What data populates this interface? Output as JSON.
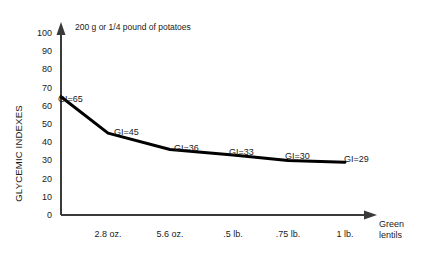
{
  "chart_data": {
    "type": "line",
    "title": "200 g or 1/4 pound of potatoes",
    "xlabel": "Green lentils",
    "ylabel": "GLYCEMIC INDEXES",
    "ylim": [
      0,
      100
    ],
    "yticks": [
      100,
      90,
      80,
      70,
      60,
      50,
      40,
      30,
      20,
      10,
      0
    ],
    "categories": [
      "",
      "2.8 oz.",
      "5.6 oz.",
      ".5 lb.",
      ".75 lb.",
      "1 lb."
    ],
    "values": [
      65,
      45,
      36,
      33,
      30,
      29
    ],
    "point_labels": [
      "GI=65",
      "GI=45",
      "GI=36",
      "GI=33",
      "GI=30",
      "GI=29"
    ],
    "grid": false,
    "legend": null,
    "line_color": "#000000",
    "axis_color": "#3a3a3a"
  },
  "axes": {
    "y_axis_title": "GLYCEMIC INDEXES",
    "x_axis_end_line1": "Green",
    "x_axis_end_line2": "lentils"
  },
  "annotation": {
    "note": "200 g or 1/4 pound of potatoes"
  }
}
